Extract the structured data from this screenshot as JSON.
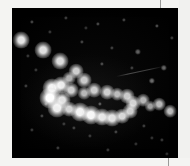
{
  "image": {
    "title": "Open star cluster photographic plate",
    "domain_description": "Monochrome astronomical photograph of a star field",
    "frame": {
      "canvas_width": 190,
      "canvas_height": 166,
      "sky_left": 12,
      "sky_top": 8,
      "sky_width": 166,
      "sky_height": 150,
      "sky_color": "#000000",
      "margin_color": "#f4f4f2",
      "star_color": "#ffffff"
    }
  },
  "chart_data": {
    "type": "scatter",
    "xlabel": "",
    "ylabel": "",
    "xlim": [
      0,
      166
    ],
    "ylim": [
      0,
      150
    ],
    "grid": false,
    "legend": "none",
    "series": [
      {
        "name": "bright-cluster-arc",
        "points": [
          {
            "x": 40,
            "y": 80,
            "size": 9,
            "brightness": 0.96
          },
          {
            "x": 49,
            "y": 77,
            "size": 8,
            "brightness": 0.92
          },
          {
            "x": 38,
            "y": 90,
            "size": 10,
            "brightness": 1.0
          },
          {
            "x": 50,
            "y": 92,
            "size": 8,
            "brightness": 0.88
          },
          {
            "x": 59,
            "y": 82,
            "size": 7,
            "brightness": 0.8
          },
          {
            "x": 45,
            "y": 100,
            "size": 9,
            "brightness": 0.93
          },
          {
            "x": 57,
            "y": 101,
            "size": 7,
            "brightness": 0.82
          },
          {
            "x": 68,
            "y": 104,
            "size": 9,
            "brightness": 0.95
          },
          {
            "x": 79,
            "y": 107,
            "size": 9,
            "brightness": 0.97
          },
          {
            "x": 90,
            "y": 109,
            "size": 8,
            "brightness": 0.9
          },
          {
            "x": 100,
            "y": 110,
            "size": 8,
            "brightness": 0.88
          },
          {
            "x": 110,
            "y": 108,
            "size": 7,
            "brightness": 0.84
          },
          {
            "x": 118,
            "y": 103,
            "size": 7,
            "brightness": 0.8
          },
          {
            "x": 121,
            "y": 95,
            "size": 7,
            "brightness": 0.82
          },
          {
            "x": 115,
            "y": 88,
            "size": 7,
            "brightness": 0.78
          },
          {
            "x": 105,
            "y": 86,
            "size": 6,
            "brightness": 0.72
          },
          {
            "x": 95,
            "y": 84,
            "size": 7,
            "brightness": 0.8
          },
          {
            "x": 82,
            "y": 82,
            "size": 7,
            "brightness": 0.79
          },
          {
            "x": 72,
            "y": 85,
            "size": 6,
            "brightness": 0.7
          }
        ]
      },
      {
        "name": "upper-left-chain",
        "points": [
          {
            "x": 9,
            "y": 32,
            "size": 8,
            "brightness": 0.9
          },
          {
            "x": 31,
            "y": 42,
            "size": 8,
            "brightness": 0.88
          },
          {
            "x": 48,
            "y": 53,
            "size": 8,
            "brightness": 0.86
          },
          {
            "x": 64,
            "y": 63,
            "size": 7,
            "brightness": 0.8
          },
          {
            "x": 72,
            "y": 72,
            "size": 7,
            "brightness": 0.78
          },
          {
            "x": 57,
            "y": 70,
            "size": 6,
            "brightness": 0.68
          }
        ]
      },
      {
        "name": "right-field-stars",
        "points": [
          {
            "x": 131,
            "y": 92,
            "size": 6,
            "brightness": 0.7
          },
          {
            "x": 138,
            "y": 98,
            "size": 5,
            "brightness": 0.62
          },
          {
            "x": 147,
            "y": 96,
            "size": 6,
            "brightness": 0.72
          },
          {
            "x": 158,
            "y": 103,
            "size": 6,
            "brightness": 0.74
          },
          {
            "x": 140,
            "y": 73,
            "size": 3,
            "brightness": 0.4
          },
          {
            "x": 152,
            "y": 60,
            "size": 3,
            "brightness": 0.38
          },
          {
            "x": 126,
            "y": 44,
            "size": 3,
            "brightness": 0.36
          }
        ]
      },
      {
        "name": "faint-field-stars",
        "points": [
          {
            "x": 20,
            "y": 14,
            "size": 2,
            "brightness": 0.25
          },
          {
            "x": 54,
            "y": 10,
            "size": 2,
            "brightness": 0.22
          },
          {
            "x": 86,
            "y": 16,
            "size": 2,
            "brightness": 0.26
          },
          {
            "x": 112,
            "y": 12,
            "size": 2,
            "brightness": 0.24
          },
          {
            "x": 145,
            "y": 18,
            "size": 2,
            "brightness": 0.28
          },
          {
            "x": 160,
            "y": 30,
            "size": 2,
            "brightness": 0.22
          },
          {
            "x": 38,
            "y": 24,
            "size": 2,
            "brightness": 0.2
          },
          {
            "x": 70,
            "y": 34,
            "size": 2,
            "brightness": 0.24
          },
          {
            "x": 100,
            "y": 40,
            "size": 2,
            "brightness": 0.22
          },
          {
            "x": 90,
            "y": 56,
            "size": 2,
            "brightness": 0.26
          },
          {
            "x": 24,
            "y": 62,
            "size": 2,
            "brightness": 0.2
          },
          {
            "x": 14,
            "y": 78,
            "size": 2,
            "brightness": 0.22
          },
          {
            "x": 30,
            "y": 108,
            "size": 2,
            "brightness": 0.24
          },
          {
            "x": 20,
            "y": 122,
            "size": 2,
            "brightness": 0.2
          },
          {
            "x": 62,
            "y": 120,
            "size": 2,
            "brightness": 0.22
          },
          {
            "x": 78,
            "y": 128,
            "size": 2,
            "brightness": 0.2
          },
          {
            "x": 104,
            "y": 124,
            "size": 2,
            "brightness": 0.24
          },
          {
            "x": 132,
            "y": 118,
            "size": 2,
            "brightness": 0.22
          },
          {
            "x": 150,
            "y": 132,
            "size": 2,
            "brightness": 0.2
          },
          {
            "x": 46,
            "y": 140,
            "size": 2,
            "brightness": 0.22
          },
          {
            "x": 96,
            "y": 142,
            "size": 2,
            "brightness": 0.2
          },
          {
            "x": 124,
            "y": 136,
            "size": 2,
            "brightness": 0.18
          },
          {
            "x": 155,
            "y": 146,
            "size": 2,
            "brightness": 0.2
          },
          {
            "x": 34,
            "y": 96,
            "size": 2,
            "brightness": 0.26
          },
          {
            "x": 52,
            "y": 116,
            "size": 2,
            "brightness": 0.2
          },
          {
            "x": 88,
            "y": 96,
            "size": 2,
            "brightness": 0.3
          },
          {
            "x": 140,
            "y": 130,
            "size": 2,
            "brightness": 0.18
          },
          {
            "x": 16,
            "y": 48,
            "size": 2,
            "brightness": 0.2
          },
          {
            "x": 120,
            "y": 60,
            "size": 2,
            "brightness": 0.22
          },
          {
            "x": 74,
            "y": 20,
            "size": 2,
            "brightness": 0.18
          }
        ]
      }
    ],
    "annotations": [
      {
        "name": "diagonal-streak",
        "description": "faint diagonal trail crossing the upper-right field",
        "x1": 104,
        "y1": 68,
        "x2": 152,
        "y2": 58,
        "brightness": 0.28
      }
    ]
  },
  "marks": {
    "top_tick": {
      "x": 160,
      "y": 0,
      "width": 1,
      "height": 10
    },
    "bottom_tick": {
      "x": 168,
      "y": 150,
      "width": 1,
      "height": 16
    }
  }
}
